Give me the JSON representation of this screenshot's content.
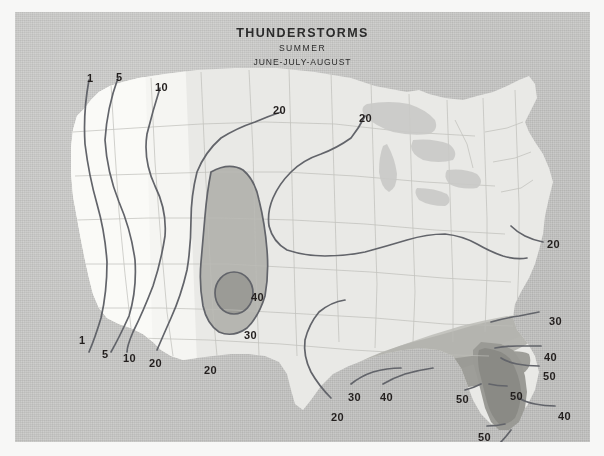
{
  "document": {
    "kind": "climatological-contour-map",
    "region": "United States",
    "title": "THUNDERSTORMS",
    "subtitle": "SUMMER",
    "period": "JUNE-JULY-AUGUST"
  },
  "colors": {
    "paper_background": "#c8c8c6",
    "mat_border": "#f7f7f6",
    "land_base": "#e9e9e6",
    "land_west_pale": "#f4f4f1",
    "zone_30": "#b3b3ae",
    "zone_40": "#9a9a95",
    "zone_50": "#8a8a85",
    "contour_line": "#5f6166",
    "state_border": "#b9b9b4",
    "label_text": "#231f1e"
  },
  "chart_data": {
    "type": "contour-map",
    "title": "THUNDERSTORMS",
    "subtitle": "SUMMER",
    "period": "JUNE-JULY-AUGUST",
    "variable": "number of days with thunderstorms",
    "contour_levels": [
      1,
      5,
      10,
      20,
      30,
      40,
      50
    ],
    "shaded_bands": [
      {
        "level": 30,
        "fill": "#b3b3ae",
        "regions": [
          "central plains",
          "southeast"
        ]
      },
      {
        "level": 40,
        "fill": "#9a9a95",
        "regions": [
          "central plains core",
          "gulf coast",
          "florida"
        ]
      },
      {
        "level": 50,
        "fill": "#8a8a85",
        "regions": [
          "florida peninsula"
        ]
      }
    ],
    "max_value_label": 50,
    "min_value_label": 1,
    "gradient_direction": "increases from west coast toward southeast"
  },
  "labels": [
    {
      "id": "nw-1",
      "value": "1",
      "x": 72,
      "y": 60,
      "level": 1
    },
    {
      "id": "nw-5",
      "value": "5",
      "x": 101,
      "y": 59,
      "level": 5
    },
    {
      "id": "nw-10",
      "value": "10",
      "x": 140,
      "y": 69,
      "level": 10
    },
    {
      "id": "n-20a",
      "value": "20",
      "x": 258,
      "y": 92,
      "level": 20
    },
    {
      "id": "n-20b",
      "value": "20",
      "x": 344,
      "y": 100,
      "level": 20
    },
    {
      "id": "e-20",
      "value": "20",
      "x": 532,
      "y": 226,
      "level": 20
    },
    {
      "id": "e-30",
      "value": "30",
      "x": 534,
      "y": 303,
      "level": 30
    },
    {
      "id": "c-40",
      "value": "40",
      "x": 236,
      "y": 279,
      "level": 40
    },
    {
      "id": "c-30",
      "value": "30",
      "x": 229,
      "y": 317,
      "level": 30
    },
    {
      "id": "sw-1",
      "value": "1",
      "x": 64,
      "y": 322,
      "level": 1
    },
    {
      "id": "sw-5",
      "value": "5",
      "x": 87,
      "y": 336,
      "level": 5
    },
    {
      "id": "sw-10",
      "value": "10",
      "x": 108,
      "y": 340,
      "level": 10
    },
    {
      "id": "sw-20",
      "value": "20",
      "x": 134,
      "y": 345,
      "level": 20
    },
    {
      "id": "tx-20",
      "value": "20",
      "x": 189,
      "y": 352,
      "level": 20
    },
    {
      "id": "tx-20b",
      "value": "20",
      "x": 316,
      "y": 399,
      "level": 20
    },
    {
      "id": "gc-30",
      "value": "30",
      "x": 333,
      "y": 379,
      "level": 30
    },
    {
      "id": "gc-40",
      "value": "40",
      "x": 365,
      "y": 379,
      "level": 40
    },
    {
      "id": "fl-40a",
      "value": "40",
      "x": 529,
      "y": 339,
      "level": 40
    },
    {
      "id": "fl-50a",
      "value": "50",
      "x": 528,
      "y": 358,
      "level": 50
    },
    {
      "id": "fl-50b",
      "value": "50",
      "x": 495,
      "y": 378,
      "level": 50
    },
    {
      "id": "fl-50c",
      "value": "50",
      "x": 441,
      "y": 381,
      "level": 50
    },
    {
      "id": "fl-40b",
      "value": "40",
      "x": 543,
      "y": 398,
      "level": 40
    },
    {
      "id": "fl-50d",
      "value": "50",
      "x": 463,
      "y": 419,
      "level": 50
    },
    {
      "id": "fl-40c",
      "value": "40",
      "x": 478,
      "y": 437,
      "level": 40
    }
  ]
}
